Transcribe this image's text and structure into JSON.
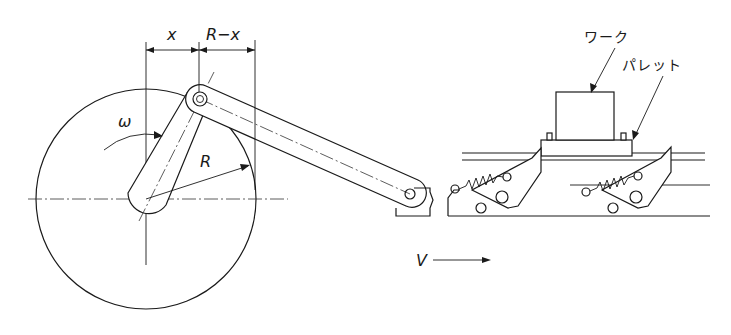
{
  "diagram": {
    "type": "mechanism-drawing",
    "labels": {
      "x": "x",
      "r_minus_x": "R−x",
      "omega": "ω",
      "radius": "R",
      "velocity": "V",
      "work": "ワーク",
      "pallet": "パレット"
    },
    "colors": {
      "line": "#1a1a1a",
      "background": "#ffffff"
    }
  }
}
